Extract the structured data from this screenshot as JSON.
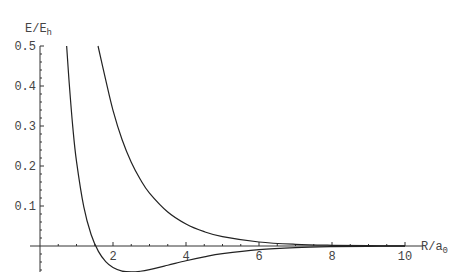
{
  "chart_data": {
    "type": "line",
    "title": "",
    "xlabel": "R/a",
    "xlabel_sub": "0",
    "ylabel": "E/E",
    "ylabel_sub": "h",
    "xlim": [
      0,
      10.5
    ],
    "ylim": [
      -0.065,
      0.5
    ],
    "x_ticks": [
      2,
      4,
      6,
      8,
      10
    ],
    "x_tick_labels": [
      "2",
      "4",
      "6",
      "8",
      "10"
    ],
    "y_ticks": [
      0.1,
      0.2,
      0.3,
      0.4,
      0.5
    ],
    "y_tick_labels": [
      "0.1",
      "0.2",
      "0.3",
      "0.4",
      "0.5"
    ],
    "grid": false,
    "legend": "none",
    "line_color": "#222222",
    "axis_color": "#333333",
    "series": [
      {
        "name": "bonding",
        "x": [
          0.73,
          0.8,
          0.9,
          1.0,
          1.2,
          1.4,
          1.6,
          1.8,
          2.0,
          2.25,
          2.5,
          2.75,
          3.0,
          3.5,
          4.0,
          4.5,
          5.0,
          6.0,
          7.0,
          8.0,
          9.0,
          10.0
        ],
        "y": [
          0.5,
          0.4076,
          0.2958,
          0.2116,
          0.0976,
          0.0286,
          -0.0135,
          -0.039,
          -0.0537,
          -0.0627,
          -0.0648,
          -0.0631,
          -0.0591,
          -0.0482,
          -0.0369,
          -0.0271,
          -0.0192,
          -0.0091,
          -0.004,
          -0.0017,
          -0.0007,
          -0.0003
        ]
      },
      {
        "name": "antibonding",
        "x": [
          1.59,
          1.8,
          2.0,
          2.25,
          2.5,
          2.75,
          3.0,
          3.5,
          4.0,
          4.5,
          5.0,
          6.0,
          7.0,
          8.0,
          9.0,
          10.0
        ],
        "y": [
          0.5,
          0.4153,
          0.3392,
          0.2655,
          0.2093,
          0.1661,
          0.1324,
          0.0851,
          0.0551,
          0.0358,
          0.0234,
          0.01,
          0.0042,
          0.0018,
          0.0007,
          0.0003
        ]
      }
    ]
  }
}
